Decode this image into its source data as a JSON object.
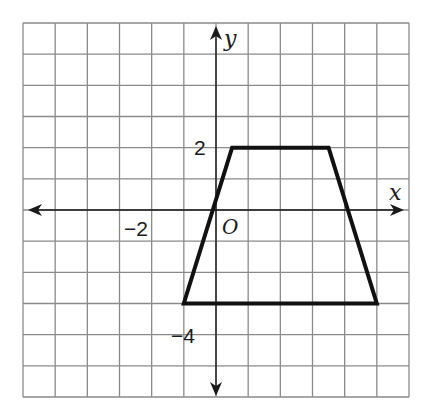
{
  "figure": {
    "type": "coordinate-grid",
    "x_axis_label": "x",
    "y_axis_label": "y",
    "origin_label": "O",
    "tick_labels": {
      "x_neg2": "−2",
      "y_2": "2",
      "y_neg4": "−4"
    },
    "grid": {
      "x_min": -6,
      "x_max": 6,
      "y_min": -6,
      "y_max": 6,
      "step": 1
    },
    "shape": {
      "name": "trapezoid",
      "vertices": [
        [
          0.5,
          2
        ],
        [
          3.5,
          2
        ],
        [
          5,
          -3
        ],
        [
          -1,
          -3
        ]
      ]
    },
    "colors": {
      "grid": "#8a8a8a",
      "axes": "#1a1a1a",
      "shape": "#111111",
      "background": "#ffffff"
    }
  }
}
